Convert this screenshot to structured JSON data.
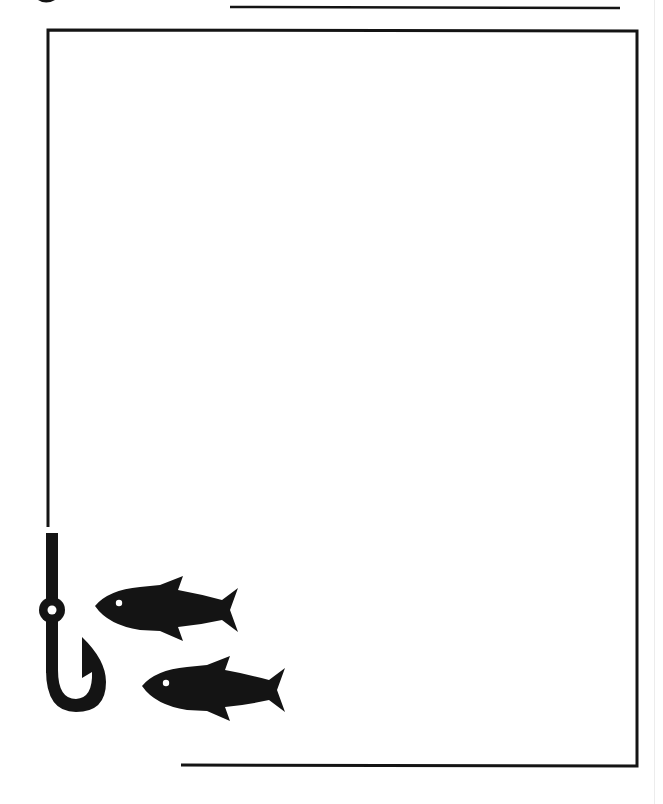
{
  "page": {
    "background": "#ffffff",
    "ink_color": "#141414",
    "faint_line_color": "#ececec"
  },
  "artwork": {
    "subject": "fishing hook and two fish frame",
    "top_rule": {
      "x1": 230,
      "y1": 7,
      "x2": 620,
      "y2": 8
    },
    "frame": {
      "left_x": 48,
      "top_y": 30,
      "right_x": 637,
      "bottom_y": 766,
      "left_line_end_y": 527,
      "bottom_line_start_x": 181
    },
    "hook": {
      "shaft_x": 52,
      "eye_center_y": 610,
      "eye_radius": 12,
      "hole_radius": 4
    },
    "fish": [
      {
        "label": "upper-fish",
        "offset_x": 0,
        "offset_y": 0
      },
      {
        "label": "lower-fish",
        "offset_x": 47,
        "offset_y": 80
      }
    ]
  }
}
